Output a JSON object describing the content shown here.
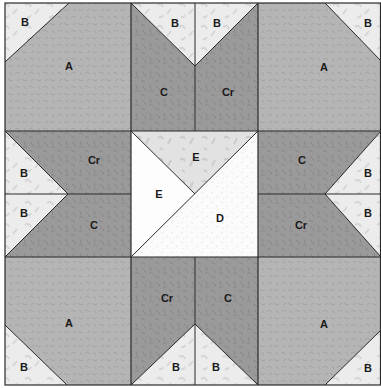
{
  "colors": {
    "A": "#b5b5b5",
    "B": "#ececec",
    "C": "#9a9a9a",
    "Cr": "#9a9a9a",
    "D": "#fbfbfb",
    "E_white": "#fdfdfd",
    "E_gray": "#e2e2e2",
    "seam": "#2a2a2a",
    "A_pattern": "#a3a3a3",
    "C_pattern": "#888888",
    "B_pattern": "#d8d8d8"
  },
  "labels": {
    "tl_A": "A",
    "tl_B": "B",
    "tc_B1": "B",
    "tc_B2": "B",
    "tc_C": "C",
    "tc_Cr": "Cr",
    "tr_A": "A",
    "tr_B": "B",
    "ml_Cr": "Cr",
    "ml_C": "C",
    "ml_B1": "B",
    "ml_B2": "B",
    "c_E_top": "E",
    "c_E_left": "E",
    "c_D": "D",
    "mr_C": "C",
    "mr_Cr": "Cr",
    "mr_B1": "B",
    "mr_B2": "B",
    "bl_A": "A",
    "bl_B": "B",
    "bc_Cr": "Cr",
    "bc_C": "C",
    "bc_B1": "B",
    "bc_B2": "B",
    "br_A": "A",
    "br_B": "B"
  }
}
